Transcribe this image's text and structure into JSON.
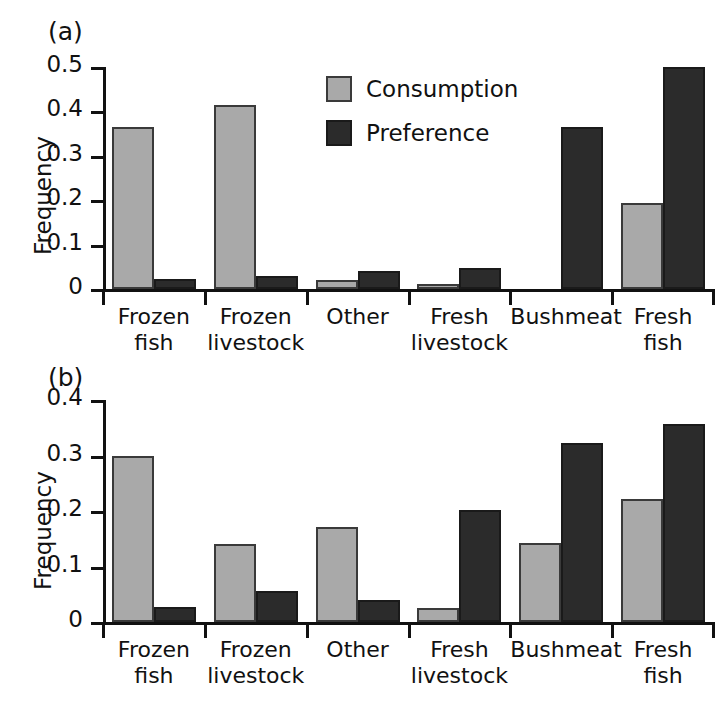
{
  "figure": {
    "background_color": "#ffffff",
    "consumption_color": "#a9a9a9",
    "preference_color": "#2b2b2b"
  },
  "panels": {
    "a": {
      "label": "(a)"
    },
    "b": {
      "label": "(b)"
    }
  },
  "legend": {
    "position": "upper-center",
    "entries": [
      {
        "label": "Consumption",
        "color": "#a9a9a9"
      },
      {
        "label": "Preference",
        "color": "#2b2b2b"
      }
    ]
  },
  "chart_data": [
    {
      "panel": "(a)",
      "type": "bar",
      "title": "",
      "xlabel": "",
      "ylabel": "Frequency",
      "ylim": [
        0,
        0.5
      ],
      "yticks": [
        0,
        0.1,
        0.2,
        0.3,
        0.4,
        0.5
      ],
      "yticklabels": [
        "0",
        "0.1",
        "0.2",
        "0.3",
        "0.4",
        "0.5"
      ],
      "grid": false,
      "legend": "upper-center",
      "categories": [
        "Frozen fish",
        "Frozen livestock",
        "Other",
        "Fresh livestock",
        "Bushmeat",
        "Fresh fish"
      ],
      "category_lines": [
        [
          "Frozen",
          "fish"
        ],
        [
          "Frozen",
          "livestock"
        ],
        [
          "Other",
          ""
        ],
        [
          "Fresh",
          "livestock"
        ],
        [
          "Bushmeat",
          ""
        ],
        [
          "Fresh",
          "fish"
        ]
      ],
      "series": [
        {
          "name": "Consumption",
          "color": "#a9a9a9",
          "values": [
            0.365,
            0.415,
            0.02,
            0.012,
            0.0,
            0.193
          ]
        },
        {
          "name": "Preference",
          "color": "#2b2b2b",
          "values": [
            0.022,
            0.03,
            0.04,
            0.048,
            0.365,
            0.5
          ]
        }
      ]
    },
    {
      "panel": "(b)",
      "type": "bar",
      "title": "",
      "xlabel": "",
      "ylabel": "Frequency",
      "ylim": [
        0,
        0.4
      ],
      "yticks": [
        0,
        0.1,
        0.2,
        0.3,
        0.4
      ],
      "yticklabels": [
        "0",
        "0.1",
        "0.2",
        "0.3",
        "0.4"
      ],
      "grid": false,
      "legend": "none",
      "categories": [
        "Frozen fish",
        "Frozen livestock",
        "Other",
        "Fresh livestock",
        "Bushmeat",
        "Fresh fish"
      ],
      "category_lines": [
        [
          "Frozen",
          "fish"
        ],
        [
          "Frozen",
          "livestock"
        ],
        [
          "Other",
          ""
        ],
        [
          "Fresh",
          "livestock"
        ],
        [
          "Bushmeat",
          ""
        ],
        [
          "Fresh",
          "fish"
        ]
      ],
      "series": [
        {
          "name": "Consumption",
          "color": "#a9a9a9",
          "values": [
            0.299,
            0.14,
            0.171,
            0.025,
            0.142,
            0.222
          ]
        },
        {
          "name": "Preference",
          "color": "#2b2b2b",
          "values": [
            0.027,
            0.055,
            0.039,
            0.202,
            0.323,
            0.356
          ]
        }
      ]
    }
  ]
}
